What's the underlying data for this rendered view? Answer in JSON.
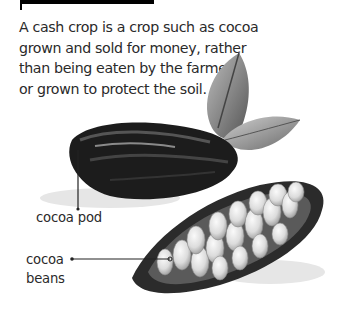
{
  "header": {
    "bar": "black-heading-bar"
  },
  "body_text": {
    "lines": [
      "A cash crop is a crop such as cocoa",
      "grown and sold for money, rather",
      "than being eaten by the farmer",
      "or grown to protect the soil."
    ]
  },
  "illustration": {
    "subject": "cocoa pods and leaves",
    "labels": {
      "pod": "cocoa pod",
      "beans_line1": "cocoa",
      "beans_line2": "beans"
    }
  }
}
